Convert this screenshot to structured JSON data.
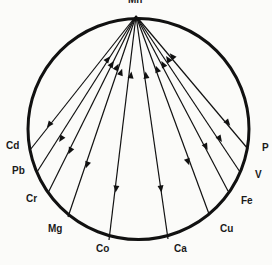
{
  "diagram": {
    "type": "interaction-circle",
    "center_node": "Mn",
    "nodes": [
      {
        "name": "Cd",
        "label_x": 6,
        "label_y": 147,
        "end": [
          30,
          150
        ],
        "up_arrow": [
          108,
          59
        ],
        "down_arrow": [
          49,
          125
        ]
      },
      {
        "name": "Pb",
        "label_x": 12,
        "label_y": 172,
        "end": [
          37,
          172
        ],
        "up_arrow": [
          112,
          64
        ],
        "down_arrow": [
          61,
          139
        ]
      },
      {
        "name": "Cr",
        "label_x": 26,
        "label_y": 200,
        "end": [
          48,
          193
        ],
        "up_arrow": [
          117,
          67
        ],
        "down_arrow": [
          70,
          151
        ]
      },
      {
        "name": "Mg",
        "label_x": 48,
        "label_y": 230,
        "end": [
          68,
          217
        ],
        "up_arrow": [
          121,
          72
        ],
        "down_arrow": [
          87,
          165
        ]
      },
      {
        "name": "Co",
        "label_x": 96,
        "label_y": 250,
        "end": [
          109,
          240
        ],
        "up_arrow": [
          131,
          75
        ],
        "down_arrow": [
          116,
          189
        ]
      },
      {
        "name": "Ca",
        "label_x": 174,
        "label_y": 250,
        "end": [
          168,
          239
        ],
        "up_arrow": [
          146,
          75
        ],
        "down_arrow": [
          161,
          189
        ]
      },
      {
        "name": "Cu",
        "label_x": 220,
        "label_y": 230,
        "end": [
          209,
          214
        ],
        "up_arrow": [
          157,
          69
        ],
        "down_arrow": [
          188,
          162
        ]
      },
      {
        "name": "Fe",
        "label_x": 241,
        "label_y": 202,
        "end": [
          228,
          191
        ],
        "up_arrow": [
          163,
          64
        ],
        "down_arrow": [
          206,
          147
        ]
      },
      {
        "name": "V",
        "label_x": 255,
        "label_y": 176,
        "end": [
          240,
          172
        ],
        "up_arrow": [
          168,
          59
        ],
        "down_arrow": [
          220,
          139
        ]
      },
      {
        "name": "P",
        "label_x": 262,
        "label_y": 149,
        "end": [
          248,
          149
        ],
        "up_arrow": [
          172,
          56
        ],
        "down_arrow": [
          228,
          123
        ]
      }
    ],
    "colors": {
      "line": "#111111",
      "background": "#fbfbf9"
    }
  }
}
